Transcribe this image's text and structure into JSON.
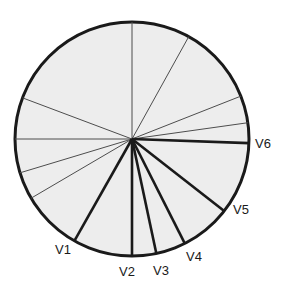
{
  "figure": {
    "name": "radial-vector-circle-diagram",
    "background_color": "#ffffff",
    "circle": {
      "center_x": 132,
      "center_y": 139,
      "radius": 117,
      "fill_color": "#ededed",
      "stroke_color": "#1a1a1a",
      "stroke_width": 3
    },
    "line_colors": {
      "thick": "#1a1a1a",
      "thin": "#4d4d4d"
    },
    "labeled_vectors": [
      {
        "label": "V1",
        "angle_deg": 240.5,
        "stroke_width": 2.6,
        "label_x": 55,
        "label_y": 254
      },
      {
        "label": "V2",
        "angle_deg": 270.0,
        "stroke_width": 2.6,
        "label_x": 119,
        "label_y": 276
      },
      {
        "label": "V3",
        "angle_deg": 282.0,
        "stroke_width": 2.6,
        "label_x": 153,
        "label_y": 275
      },
      {
        "label": "V4",
        "angle_deg": 296.8,
        "stroke_width": 2.6,
        "label_x": 186,
        "label_y": 261
      },
      {
        "label": "V5",
        "angle_deg": 322.0,
        "stroke_width": 2.6,
        "label_x": 233,
        "label_y": 214
      },
      {
        "label": "V6",
        "angle_deg": 358.0,
        "stroke_width": 2.6,
        "label_x": 255,
        "label_y": 148
      }
    ],
    "unlabeled_vectors": [
      {
        "angle_deg": 90.0,
        "stroke_width": 1.0
      },
      {
        "angle_deg": 61.0,
        "stroke_width": 1.0
      },
      {
        "angle_deg": 21.5,
        "stroke_width": 1.0
      },
      {
        "angle_deg": 8.0,
        "stroke_width": 1.0
      },
      {
        "angle_deg": 180.0,
        "stroke_width": 1.0
      },
      {
        "angle_deg": 159.4,
        "stroke_width": 1.0
      },
      {
        "angle_deg": 196.8,
        "stroke_width": 1.0
      },
      {
        "angle_deg": 210.4,
        "stroke_width": 1.0
      }
    ]
  }
}
